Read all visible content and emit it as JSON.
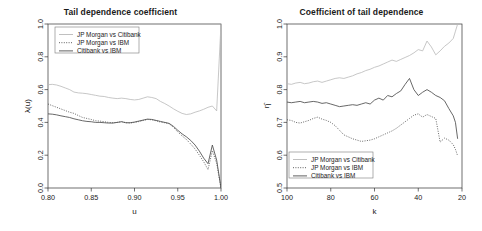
{
  "figure": {
    "width": 482,
    "height": 231,
    "background": "#ffffff"
  },
  "colors": {
    "series_jpm_citi": "#b9b9b9",
    "series_jpm_ibm": "#4d4d4d",
    "series_citi_ibm": "#4d4d4d",
    "axis": "#333333",
    "text": "#1a1a1a",
    "legend_border": "#7a7a7a"
  },
  "chart_data": [
    {
      "type": "line",
      "id": "tail-dependence-coefficient",
      "title": "Tail dependence coefficient",
      "xlabel": "u",
      "ylabel": "λ(u)",
      "xlim": [
        0.8,
        1.0
      ],
      "ylim": [
        0.0,
        1.0
      ],
      "xticks": [
        "0.80",
        "0.85",
        "0.90",
        "0.95",
        "1.00"
      ],
      "xtick_values": [
        0.8,
        0.85,
        0.9,
        0.95,
        1.0
      ],
      "yticks": [
        "0.0",
        "0.2",
        "0.4",
        "0.6",
        "0.8",
        "1.0"
      ],
      "ytick_values": [
        0.0,
        0.2,
        0.4,
        0.6,
        0.8,
        1.0
      ],
      "grid": false,
      "legend_position": "top-left",
      "x": [
        0.8,
        0.805,
        0.81,
        0.815,
        0.82,
        0.825,
        0.83,
        0.835,
        0.84,
        0.845,
        0.85,
        0.855,
        0.86,
        0.865,
        0.87,
        0.875,
        0.88,
        0.885,
        0.89,
        0.895,
        0.9,
        0.905,
        0.91,
        0.915,
        0.92,
        0.925,
        0.93,
        0.935,
        0.94,
        0.945,
        0.95,
        0.955,
        0.96,
        0.965,
        0.97,
        0.975,
        0.98,
        0.985,
        0.99,
        0.995,
        1.0
      ],
      "series": [
        {
          "name": "JP Morgan vs Citibank",
          "style": "solid-light",
          "color": "#b9b9b9",
          "values": [
            0.63,
            0.632,
            0.628,
            0.62,
            0.61,
            0.6,
            0.585,
            0.58,
            0.578,
            0.575,
            0.57,
            0.565,
            0.56,
            0.558,
            0.552,
            0.548,
            0.545,
            0.548,
            0.545,
            0.54,
            0.537,
            0.54,
            0.548,
            0.556,
            0.552,
            0.545,
            0.528,
            0.515,
            0.5,
            0.483,
            0.468,
            0.455,
            0.448,
            0.452,
            0.462,
            0.47,
            0.48,
            0.492,
            0.5,
            0.47,
            1.0
          ]
        },
        {
          "name": "JP Morgan vs IBM",
          "style": "dotted",
          "color": "#4d4d4d",
          "values": [
            0.512,
            0.502,
            0.492,
            0.482,
            0.472,
            0.462,
            0.455,
            0.442,
            0.43,
            0.424,
            0.418,
            0.41,
            0.408,
            0.404,
            0.4,
            0.398,
            0.4,
            0.405,
            0.398,
            0.396,
            0.4,
            0.405,
            0.412,
            0.418,
            0.416,
            0.41,
            0.402,
            0.398,
            0.392,
            0.37,
            0.342,
            0.318,
            0.296,
            0.268,
            0.238,
            0.2,
            0.16,
            0.112,
            0.228,
            0.15,
            0.0
          ]
        },
        {
          "name": "Citibank vs IBM",
          "style": "solid",
          "color": "#4d4d4d",
          "values": [
            0.452,
            0.45,
            0.446,
            0.44,
            0.435,
            0.43,
            0.422,
            0.416,
            0.41,
            0.406,
            0.404,
            0.4,
            0.4,
            0.398,
            0.396,
            0.396,
            0.4,
            0.404,
            0.398,
            0.398,
            0.402,
            0.408,
            0.414,
            0.42,
            0.418,
            0.412,
            0.406,
            0.4,
            0.394,
            0.376,
            0.352,
            0.33,
            0.312,
            0.29,
            0.262,
            0.225,
            0.182,
            0.148,
            0.262,
            0.17,
            0.0
          ]
        }
      ],
      "legend_items": [
        {
          "label": "JP Morgan vs Citibank",
          "style": "solid-light"
        },
        {
          "label": "JP Morgan vs IBM",
          "style": "dotted"
        },
        {
          "label": "Citibank vs IBM",
          "style": "solid"
        }
      ]
    },
    {
      "type": "line",
      "id": "coefficient-of-tail-dependence",
      "title": "Coefficient of tail dependence",
      "xlabel": "k",
      "ylabel": "η̂",
      "xlim": [
        100,
        20
      ],
      "ylim": [
        0.5,
        1.0
      ],
      "xticks": [
        "100",
        "80",
        "60",
        "40",
        "20"
      ],
      "xtick_values": [
        100,
        80,
        60,
        40,
        20
      ],
      "yticks": [
        "0.5",
        "0.6",
        "0.7",
        "0.8",
        "0.9",
        "1.0"
      ],
      "ytick_values": [
        0.5,
        0.6,
        0.7,
        0.8,
        0.9,
        1.0
      ],
      "grid": false,
      "legend_position": "bottom-left",
      "x": [
        100,
        98,
        96,
        94,
        92,
        90,
        88,
        86,
        84,
        82,
        80,
        78,
        76,
        74,
        72,
        70,
        68,
        66,
        64,
        62,
        60,
        58,
        56,
        54,
        52,
        50,
        48,
        46,
        44,
        42,
        40,
        38,
        36,
        34,
        32,
        30,
        28,
        26,
        24,
        23,
        22
      ],
      "series": [
        {
          "name": "JP Morgan vs Citibank",
          "style": "solid-light",
          "color": "#b9b9b9",
          "values": [
            0.818,
            0.816,
            0.82,
            0.822,
            0.818,
            0.82,
            0.824,
            0.826,
            0.822,
            0.826,
            0.83,
            0.834,
            0.836,
            0.834,
            0.838,
            0.842,
            0.848,
            0.852,
            0.858,
            0.862,
            0.868,
            0.872,
            0.878,
            0.884,
            0.89,
            0.886,
            0.892,
            0.898,
            0.904,
            0.912,
            0.922,
            0.918,
            0.948,
            0.93,
            0.906,
            0.918,
            0.932,
            0.942,
            0.956,
            0.978,
            1.0
          ]
        },
        {
          "name": "JP Morgan vs IBM",
          "style": "dotted",
          "color": "#4d4d4d",
          "values": [
            0.708,
            0.706,
            0.7,
            0.698,
            0.702,
            0.706,
            0.712,
            0.716,
            0.71,
            0.706,
            0.7,
            0.69,
            0.676,
            0.662,
            0.656,
            0.65,
            0.646,
            0.642,
            0.644,
            0.646,
            0.65,
            0.656,
            0.662,
            0.668,
            0.674,
            0.682,
            0.692,
            0.702,
            0.712,
            0.722,
            0.726,
            0.716,
            0.724,
            0.718,
            0.712,
            0.64,
            0.652,
            0.646,
            0.632,
            0.618,
            0.598
          ]
        },
        {
          "name": "Citibank vs IBM",
          "style": "solid",
          "color": "#4d4d4d",
          "values": [
            0.762,
            0.76,
            0.762,
            0.764,
            0.76,
            0.762,
            0.764,
            0.762,
            0.758,
            0.76,
            0.756,
            0.752,
            0.748,
            0.75,
            0.752,
            0.754,
            0.752,
            0.756,
            0.76,
            0.756,
            0.768,
            0.774,
            0.768,
            0.782,
            0.778,
            0.788,
            0.796,
            0.816,
            0.834,
            0.8,
            0.782,
            0.792,
            0.8,
            0.792,
            0.782,
            0.776,
            0.766,
            0.742,
            0.72,
            0.7,
            0.65
          ]
        }
      ],
      "legend_items": [
        {
          "label": "JP Morgan vs Citibank",
          "style": "solid-light"
        },
        {
          "label": "JP Morgan vs IBM",
          "style": "dotted"
        },
        {
          "label": "Citibank vs IBM",
          "style": "solid"
        }
      ]
    }
  ]
}
